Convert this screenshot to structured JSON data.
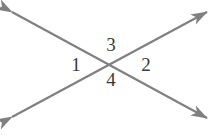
{
  "figure": {
    "name": "intersecting-lines-angle-diagram",
    "width": 214,
    "height": 140,
    "background_color": "#ffffff",
    "line_color": "#808080",
    "label_color": "#3a3a3a",
    "line_width": 2.2,
    "intersection": {
      "x": 112,
      "y": 62
    },
    "lines": [
      {
        "id": "line-nw-se",
        "description": "double-headed arrow from upper-left to lower-right",
        "x1": 12,
        "y1": 12,
        "x2": 207,
        "y2": 118
      },
      {
        "id": "line-sw-ne",
        "description": "double-headed arrow from lower-left to upper-right",
        "x1": 12,
        "y1": 117,
        "x2": 207,
        "y2": 12
      }
    ],
    "arrowheads": [
      {
        "name": "arrowhead-top-left",
        "x": 12,
        "y": 12
      },
      {
        "name": "arrowhead-bottom-right",
        "x": 207,
        "y": 118
      },
      {
        "name": "arrowhead-bottom-left",
        "x": 12,
        "y": 117
      },
      {
        "name": "arrowhead-top-right",
        "x": 207,
        "y": 12
      }
    ],
    "labels": [
      {
        "id": "angle-label-1",
        "text": "1",
        "x": 76,
        "y": 64,
        "position": "left"
      },
      {
        "id": "angle-label-2",
        "text": "2",
        "x": 146,
        "y": 64,
        "position": "right"
      },
      {
        "id": "angle-label-3",
        "text": "3",
        "x": 111,
        "y": 44,
        "position": "top"
      },
      {
        "id": "angle-label-4",
        "text": "4",
        "x": 111,
        "y": 79,
        "position": "bottom"
      }
    ]
  }
}
